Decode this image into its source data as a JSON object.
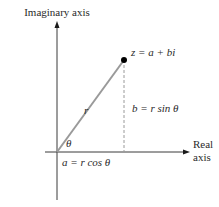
{
  "diagram": {
    "axes": {
      "vertical_label": "Imaginary axis",
      "horizontal_label_line1": "Real",
      "horizontal_label_line2": "axis"
    },
    "point": {
      "label": "z = a + bi"
    },
    "segments": {
      "modulus_label": "r",
      "angle_label": "θ",
      "vertical_component": "b = r sin θ",
      "horizontal_component": "a = r cos θ"
    },
    "colors": {
      "axis": "#3a3a3a",
      "radius_line": "#9a9a9a",
      "dashed_line": "#9a9a9a",
      "point": "#000000",
      "text": "#2a2a2a"
    }
  }
}
